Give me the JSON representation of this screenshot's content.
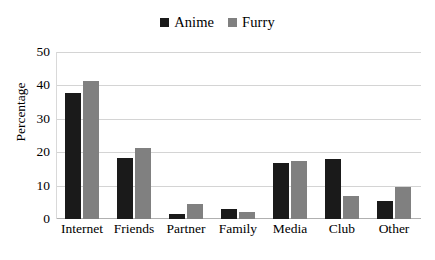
{
  "chart_data": {
    "type": "bar",
    "title": "",
    "subtitle": "",
    "xlabel": "",
    "ylabel": "Percentage",
    "ylim": [
      0,
      50
    ],
    "yticks": [
      0,
      10,
      20,
      30,
      40,
      50
    ],
    "grid": true,
    "legend_position": "top-center",
    "categories": [
      "Internet",
      "Friends",
      "Partner",
      "Family",
      "Media",
      "Club",
      "Other"
    ],
    "series": [
      {
        "name": "Anime",
        "color": "#1a1a1a",
        "values": [
          38,
          18.5,
          1.5,
          3,
          17,
          18,
          5.5
        ]
      },
      {
        "name": "Furry",
        "color": "#808080",
        "values": [
          41.5,
          21.5,
          4.5,
          2,
          17.5,
          7,
          9.5
        ]
      }
    ]
  },
  "legend": {
    "items": [
      {
        "label": "Anime",
        "color": "#1a1a1a",
        "swatch": "square-swatch"
      },
      {
        "label": "Furry",
        "color": "#808080",
        "swatch": "square-swatch"
      }
    ]
  },
  "axes": {
    "y": {
      "label": "Percentage",
      "ticks": [
        "50",
        "40",
        "30",
        "20",
        "10",
        "0"
      ]
    },
    "x": {
      "ticks": [
        "Internet",
        "Friends",
        "Partner",
        "Family",
        "Media",
        "Club",
        "Other"
      ]
    }
  },
  "colors": {
    "anime": "#1a1a1a",
    "furry": "#808080",
    "gridline": "#d4d4d4",
    "axis": "#b0b0b0",
    "background": "#ffffff",
    "text": "#000000"
  }
}
